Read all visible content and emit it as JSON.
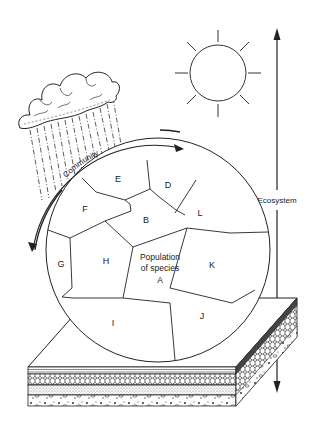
{
  "diagram": {
    "type": "ecosystem-hierarchy",
    "labels": {
      "community": "Community",
      "ecosystem": "Ecosystem",
      "population_line1": "Population",
      "population_line2": "of species",
      "population_letter": "A"
    },
    "species_regions": [
      "A",
      "B",
      "D",
      "E",
      "F",
      "G",
      "H",
      "I",
      "J",
      "K",
      "L"
    ],
    "region_labels": {
      "E": "E",
      "D": "D",
      "F": "F",
      "B": "B",
      "L": "L",
      "G": "G",
      "H": "H",
      "K": "K",
      "I": "I",
      "J": "J"
    },
    "elements": [
      "cloud-with-rain",
      "sun",
      "community-circle",
      "soil-block",
      "ecosystem-arrow",
      "community-curved-arrows"
    ],
    "colors": {
      "line": "#222222",
      "background": "#ffffff"
    }
  }
}
